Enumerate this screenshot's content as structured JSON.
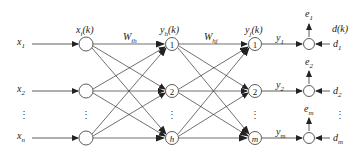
{
  "diagram": {
    "type": "neural-network-bp",
    "inputs": [
      {
        "label": "x",
        "sub": "1"
      },
      {
        "label": "x",
        "sub": "2"
      },
      {
        "label": "x",
        "sub": "n"
      }
    ],
    "input_layer_label": {
      "main": "x",
      "sub": "i",
      "tail": "(k)"
    },
    "hidden_layer_label": {
      "main": "y",
      "sub": "h",
      "tail": "(k)"
    },
    "output_layer_label": {
      "main": "y",
      "sub": "j",
      "tail": "(k)"
    },
    "weights_ih": {
      "main": "W",
      "sub": "ih"
    },
    "weights_hj": {
      "main": "W",
      "sub": "hj"
    },
    "hidden_nodes": [
      "1",
      "2",
      "h"
    ],
    "output_nodes": [
      "1",
      "2",
      "m"
    ],
    "outputs": [
      {
        "label": "y",
        "sub": "1"
      },
      {
        "label": "y",
        "sub": "2"
      },
      {
        "label": "y",
        "sub": "m"
      }
    ],
    "errors": [
      {
        "label": "e",
        "sub": "1"
      },
      {
        "label": "e",
        "sub": "2"
      },
      {
        "label": "e",
        "sub": "m"
      }
    ],
    "desired_label": "d(k)",
    "desired": [
      {
        "label": "d",
        "sub": "1"
      },
      {
        "label": "d",
        "sub": "2"
      },
      {
        "label": "d",
        "sub": "m"
      }
    ],
    "ellipsis": "⋮",
    "colors": {
      "stroke": "#333333",
      "background": "#ffffff"
    }
  }
}
